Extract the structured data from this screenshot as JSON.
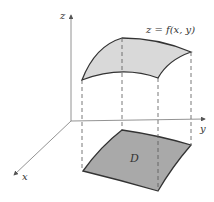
{
  "diagram": {
    "axes": {
      "z_label": "z",
      "y_label": "y",
      "x_label": "x"
    },
    "surface_label": "z = f(x, y)",
    "region_label": "D",
    "colors": {
      "surface_fill": "#d9d9d9",
      "region_fill": "#a9a9a9",
      "stroke": "#333333",
      "axis": "#777777"
    }
  }
}
